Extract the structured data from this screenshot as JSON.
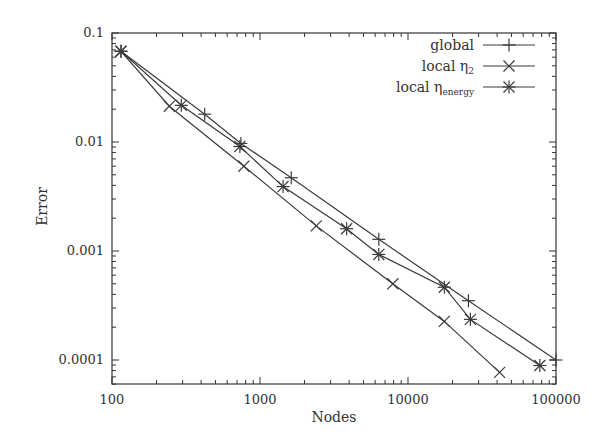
{
  "chart_data": {
    "type": "line",
    "title": "",
    "xlabel": "Nodes",
    "ylabel": "Error",
    "xscale": "log",
    "yscale": "log",
    "xlim": [
      100,
      100000
    ],
    "ylim": [
      6e-05,
      0.1
    ],
    "x_ticks": [
      {
        "value": 100,
        "label": "100"
      },
      {
        "value": 1000,
        "label": "1000"
      },
      {
        "value": 10000,
        "label": "10000"
      },
      {
        "value": 100000,
        "label": "100000"
      }
    ],
    "y_ticks": [
      {
        "value": 0.1,
        "label": "0.1"
      },
      {
        "value": 0.01,
        "label": "0.01"
      },
      {
        "value": 0.001,
        "label": "0.001"
      },
      {
        "value": 0.0001,
        "label": "0.0001"
      }
    ],
    "grid": false,
    "legend_position": "top-right",
    "series": [
      {
        "name": "global",
        "legend_label": "global",
        "marker": "plus",
        "points": [
          [
            115,
            0.068
          ],
          [
            423,
            0.018
          ],
          [
            743,
            0.0097
          ],
          [
            1626,
            0.0047
          ],
          [
            6350,
            0.00128
          ],
          [
            25600,
            0.00035
          ],
          [
            100000,
            0.0001
          ]
        ]
      },
      {
        "name": "local eta_2",
        "legend_label": "local η",
        "legend_sub": "2",
        "marker": "cross",
        "points": [
          [
            115,
            0.068
          ],
          [
            244,
            0.0213
          ],
          [
            778,
            0.006
          ],
          [
            2400,
            0.0017
          ],
          [
            7900,
            0.0005
          ],
          [
            17600,
            0.000226
          ],
          [
            41600,
            7.7e-05
          ]
        ]
      },
      {
        "name": "local eta_energy",
        "legend_label": "local η",
        "legend_sub": "energy",
        "marker": "star",
        "points": [
          [
            115,
            0.068
          ],
          [
            294,
            0.0217
          ],
          [
            731,
            0.0091
          ],
          [
            1432,
            0.0039
          ],
          [
            3850,
            0.0016
          ],
          [
            6350,
            0.00093
          ],
          [
            17600,
            0.000465
          ],
          [
            26400,
            0.000236
          ],
          [
            77800,
            8.9e-05
          ]
        ]
      }
    ]
  },
  "colors": {
    "line": "#3a3a3a",
    "axis": "#333333",
    "text": "#333333",
    "background": "#ffffff"
  }
}
